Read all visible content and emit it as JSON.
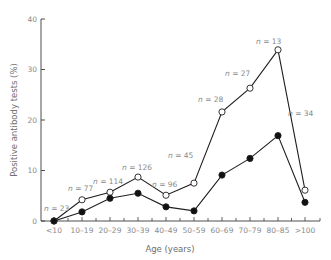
{
  "chart_data": {
    "type": "line",
    "title": "",
    "xlabel": "Age (years)",
    "ylabel": "Positive antibody tests (%)",
    "ylim": [
      0,
      40
    ],
    "yticks": [
      0,
      10,
      20,
      30,
      40
    ],
    "grid": false,
    "legend": null,
    "categories": [
      "<10",
      "10–19",
      "20–29",
      "30–39",
      "40–49",
      "50–59",
      "60–69",
      "70–79",
      "80–85",
      ">100"
    ],
    "series": [
      {
        "name": "open circles",
        "marker": "open-circle",
        "values": [
          0,
          4.2,
          5.7,
          8.7,
          5.1,
          7.5,
          21.6,
          26.3,
          33.9,
          6.1
        ]
      },
      {
        "name": "filled circles",
        "marker": "filled-circle",
        "values": [
          0,
          1.8,
          4.5,
          5.5,
          2.8,
          2.0,
          9.1,
          12.4,
          16.9,
          3.7
        ]
      }
    ],
    "annotations": [
      {
        "category": "<10",
        "text": "n = 23"
      },
      {
        "category": "10–19",
        "text": "n = 77"
      },
      {
        "category": "20–29",
        "text": "n = 114"
      },
      {
        "category": "30–39",
        "text": "n = 126"
      },
      {
        "category": "40–49",
        "text": "n = 96"
      },
      {
        "category": "50–59",
        "text": "n = 45"
      },
      {
        "category": "60–69",
        "text": "n = 28"
      },
      {
        "category": "70–79",
        "text": "n = 27"
      },
      {
        "category": "80–85",
        "text": "n = 13"
      },
      {
        "category": ">100",
        "text": "n = 34"
      }
    ]
  }
}
